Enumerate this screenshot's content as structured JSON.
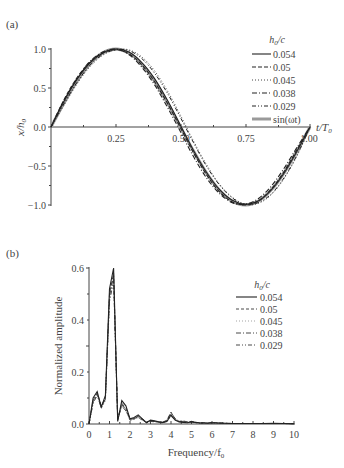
{
  "chart_data": [
    {
      "panel_label": "(a)",
      "type": "line",
      "title": "",
      "xlabel": "t/T0",
      "ylabel": "x/h0",
      "xlim": [
        0,
        1.0
      ],
      "ylim": [
        -1.0,
        1.0
      ],
      "xticks": [
        "0.25",
        "0.50",
        "0.75",
        "1.00"
      ],
      "yticks": [
        "1.0",
        "0.5",
        "0.0",
        "-0.5",
        "-1.0"
      ],
      "grid": false,
      "legend_position": "upper right",
      "legend_title": "h0/c",
      "x": [
        0,
        0.05,
        0.1,
        0.15,
        0.2,
        0.25,
        0.3,
        0.35,
        0.4,
        0.45,
        0.5,
        0.55,
        0.6,
        0.65,
        0.7,
        0.75,
        0.8,
        0.85,
        0.9,
        0.95,
        1.0
      ],
      "series": [
        {
          "name": "0.054",
          "style": "solid",
          "values": [
            0,
            0.33,
            0.61,
            0.82,
            0.95,
            1.0,
            0.96,
            0.83,
            0.62,
            0.34,
            0.02,
            -0.3,
            -0.58,
            -0.8,
            -0.94,
            -0.99,
            -0.95,
            -0.81,
            -0.59,
            -0.31,
            0
          ]
        },
        {
          "name": "0.05",
          "style": "dashed",
          "values": [
            0,
            0.35,
            0.63,
            0.83,
            0.95,
            0.99,
            0.94,
            0.8,
            0.58,
            0.3,
            -0.01,
            -0.33,
            -0.61,
            -0.83,
            -0.96,
            -1.0,
            -0.95,
            -0.8,
            -0.57,
            -0.29,
            0
          ]
        },
        {
          "name": "0.045",
          "style": "dotted",
          "values": [
            0,
            0.28,
            0.55,
            0.77,
            0.92,
            0.99,
            0.99,
            0.9,
            0.72,
            0.46,
            0.15,
            -0.18,
            -0.48,
            -0.73,
            -0.9,
            -0.99,
            -0.98,
            -0.87,
            -0.66,
            -0.37,
            0
          ]
        },
        {
          "name": "0.038",
          "style": "dash-dot",
          "values": [
            0,
            0.34,
            0.62,
            0.84,
            0.96,
            1.0,
            0.93,
            0.77,
            0.54,
            0.25,
            -0.06,
            -0.38,
            -0.65,
            -0.85,
            -0.97,
            -0.99,
            -0.92,
            -0.76,
            -0.53,
            -0.26,
            0
          ]
        },
        {
          "name": "0.029",
          "style": "dash-dot-dot",
          "values": [
            0,
            0.3,
            0.57,
            0.79,
            0.93,
            0.99,
            0.98,
            0.88,
            0.69,
            0.43,
            0.12,
            -0.2,
            -0.5,
            -0.74,
            -0.91,
            -0.99,
            -0.97,
            -0.86,
            -0.65,
            -0.36,
            0
          ]
        },
        {
          "name": "sin(ωt)",
          "style": "solid-gray-thick",
          "values": [
            0,
            0.309,
            0.588,
            0.809,
            0.951,
            1.0,
            0.951,
            0.809,
            0.588,
            0.309,
            0,
            -0.309,
            -0.588,
            -0.809,
            -0.951,
            -1.0,
            -0.951,
            -0.809,
            -0.588,
            -0.309,
            0
          ]
        }
      ]
    },
    {
      "panel_label": "(b)",
      "type": "line",
      "title": "",
      "xlabel": "Frequency/f0",
      "ylabel": "Normalized amplitude",
      "xlim": [
        0,
        10
      ],
      "ylim": [
        0,
        0.6
      ],
      "xticks": [
        "0",
        "1",
        "2",
        "3",
        "4",
        "5",
        "6",
        "7",
        "8",
        "9",
        "10"
      ],
      "yticks": [
        "0.0",
        "0.2",
        "0.4",
        "0.6"
      ],
      "grid": false,
      "legend_position": "upper right",
      "legend_title": "h0/c",
      "x": [
        0,
        0.2,
        0.4,
        0.6,
        0.8,
        1.0,
        1.2,
        1.4,
        1.6,
        1.8,
        2.0,
        2.2,
        2.4,
        2.6,
        2.8,
        3.0,
        3.2,
        3.4,
        3.6,
        3.8,
        4.0,
        4.2,
        4.4,
        4.6,
        4.8,
        5.0,
        5.2,
        5.4,
        5.6,
        5.8,
        6.0,
        6.5,
        7.0,
        7.5,
        8.0,
        8.5,
        9.0,
        9.5,
        10.0
      ],
      "series": [
        {
          "name": "0.054",
          "style": "solid",
          "values": [
            0,
            0.1,
            0.125,
            0.065,
            0.11,
            0.52,
            0.6,
            0.01,
            0.09,
            0.07,
            0.02,
            0.025,
            0.035,
            0.02,
            0.005,
            0.015,
            0.012,
            0.008,
            0.006,
            0.01,
            0.035,
            0.015,
            0.008,
            0.006,
            0.005,
            0.008,
            0.006,
            0.004,
            0.004,
            0.003,
            0.005,
            0.003,
            0.002,
            0.002,
            0.002,
            0.002,
            0.003,
            0.002,
            0.001
          ]
        },
        {
          "name": "0.05",
          "style": "dashed",
          "values": [
            0,
            0.09,
            0.12,
            0.07,
            0.1,
            0.5,
            0.58,
            0.02,
            0.08,
            0.06,
            0.02,
            0.02,
            0.03,
            0.02,
            0.008,
            0.012,
            0.01,
            0.008,
            0.007,
            0.015,
            0.045,
            0.02,
            0.01,
            0.012,
            0.008,
            0.01,
            0.006,
            0.005,
            0.005,
            0.004,
            0.006,
            0.003,
            0.002,
            0.002,
            0.002,
            0.002,
            0.002,
            0.002,
            0.001
          ]
        },
        {
          "name": "0.045",
          "style": "dotted",
          "values": [
            0,
            0.08,
            0.11,
            0.06,
            0.09,
            0.48,
            0.56,
            0.015,
            0.07,
            0.05,
            0.015,
            0.02,
            0.025,
            0.015,
            0.006,
            0.01,
            0.01,
            0.007,
            0.006,
            0.012,
            0.04,
            0.018,
            0.008,
            0.01,
            0.007,
            0.008,
            0.005,
            0.004,
            0.004,
            0.003,
            0.004,
            0.003,
            0.002,
            0.002,
            0.002,
            0.002,
            0.002,
            0.002,
            0.001
          ]
        },
        {
          "name": "0.038",
          "style": "dash-dot",
          "values": [
            0,
            0.085,
            0.115,
            0.06,
            0.1,
            0.49,
            0.57,
            0.015,
            0.075,
            0.055,
            0.02,
            0.02,
            0.03,
            0.018,
            0.006,
            0.012,
            0.01,
            0.007,
            0.006,
            0.012,
            0.045,
            0.02,
            0.01,
            0.01,
            0.008,
            0.01,
            0.005,
            0.004,
            0.004,
            0.003,
            0.005,
            0.003,
            0.002,
            0.002,
            0.002,
            0.002,
            0.002,
            0.002,
            0.001
          ]
        },
        {
          "name": "0.029",
          "style": "dash-dot-dot",
          "values": [
            0,
            0.08,
            0.11,
            0.065,
            0.095,
            0.47,
            0.55,
            0.02,
            0.07,
            0.05,
            0.015,
            0.018,
            0.025,
            0.015,
            0.005,
            0.01,
            0.008,
            0.006,
            0.005,
            0.01,
            0.03,
            0.015,
            0.008,
            0.008,
            0.006,
            0.008,
            0.005,
            0.004,
            0.004,
            0.003,
            0.004,
            0.003,
            0.002,
            0.002,
            0.002,
            0.002,
            0.002,
            0.002,
            0.001
          ]
        }
      ]
    }
  ],
  "panel_a": {
    "label": "(a)",
    "ylabel": "x/h",
    "ylabel_sub": "0",
    "xlabel": "t/T",
    "xlabel_sub": "0",
    "yticks": [
      "1.0",
      "0.5",
      "0.0",
      "−0.5",
      "−1.0"
    ],
    "xticks": [
      "0.25",
      "0.50",
      "0.75",
      "1.00"
    ],
    "legend_title": "h",
    "legend_title_sub": "0",
    "legend_title_tail": "/c",
    "legend": [
      "0.054",
      "0.05",
      "0.045",
      "0.038",
      "0.029",
      "sin(ωt)"
    ]
  },
  "panel_b": {
    "label": "(b)",
    "ylabel": "Normalized amplitude",
    "xlabel": "Frequency/f",
    "xlabel_sub": "0",
    "yticks": [
      "0.6",
      "0.4",
      "0.2",
      "0.0"
    ],
    "xticks": [
      "0",
      "1",
      "2",
      "3",
      "4",
      "5",
      "6",
      "7",
      "8",
      "9",
      "10"
    ],
    "legend_title": "h",
    "legend_title_sub": "0",
    "legend_title_tail": "/c",
    "legend": [
      "0.054",
      "0.05",
      "0.045",
      "0.038",
      "0.029"
    ]
  }
}
